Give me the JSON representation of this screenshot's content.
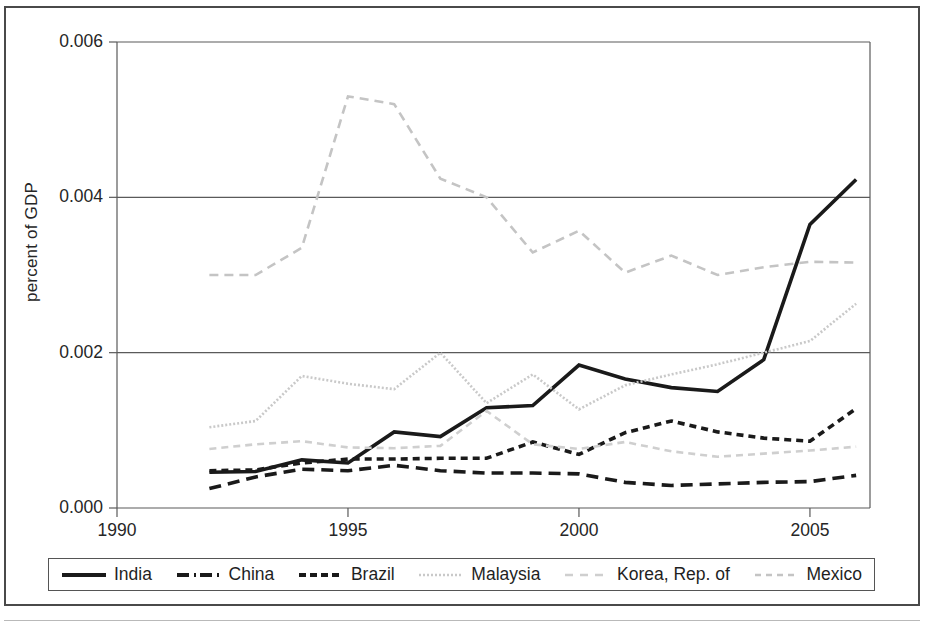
{
  "figure": {
    "yaxis_title": "percent of GDP",
    "ytick_labels": [
      "0.006",
      "0.004",
      "0.002",
      "0.000"
    ],
    "xtick_labels": [
      "1990",
      "1995",
      "2000",
      "2005"
    ]
  },
  "legend": {
    "items": [
      {
        "label": "India",
        "style": "solid-thick-black",
        "color": "#1a1a1a"
      },
      {
        "label": "China",
        "style": "dashdot-thick-black",
        "color": "#1a1a1a"
      },
      {
        "label": "Brazil",
        "style": "dashed-thick-black",
        "color": "#1a1a1a"
      },
      {
        "label": "Malaysia",
        "style": "solid-thin-gray",
        "color": "#c9c9c9"
      },
      {
        "label": "Korea, Rep. of",
        "style": "dashed-thin-gray",
        "color": "#cfcfcf"
      },
      {
        "label": "Mexico",
        "style": "dashed-gray",
        "color": "#c4c4c4"
      }
    ]
  },
  "chart_data": {
    "type": "line",
    "title": "",
    "xlabel": "",
    "ylabel": "percent of GDP",
    "xlim": [
      1990,
      2006.3
    ],
    "ylim": [
      0.0,
      0.006
    ],
    "yticks": [
      0.0,
      0.002,
      0.004,
      0.006
    ],
    "xticks": [
      1990,
      1995,
      2000,
      2005
    ],
    "grid": "horizontal",
    "legend_position": "below-axes",
    "x": [
      1992,
      1993,
      1994,
      1995,
      1996,
      1997,
      1998,
      1999,
      2000,
      2001,
      2002,
      2003,
      2004,
      2005,
      2006
    ],
    "series": [
      {
        "name": "India",
        "color": "#1a1a1a",
        "dash": "none",
        "width": 3.6,
        "values": [
          0.00046,
          0.00047,
          0.00062,
          0.00058,
          0.00098,
          0.00092,
          0.00129,
          0.00132,
          0.00184,
          0.00166,
          0.00155,
          0.0015,
          0.00191,
          0.00365,
          0.00423
        ]
      },
      {
        "name": "China",
        "color": "#1a1a1a",
        "dash": "12,7",
        "width": 3.6,
        "values": [
          0.00025,
          0.0004,
          0.0005,
          0.00048,
          0.00055,
          0.00048,
          0.00045,
          0.00045,
          0.00044,
          0.00033,
          0.00029,
          0.00031,
          0.00033,
          0.00034,
          0.00042
        ]
      },
      {
        "name": "Brazil",
        "color": "#1a1a1a",
        "dash": "7,5",
        "width": 3.6,
        "values": [
          0.00048,
          0.00049,
          0.00058,
          0.00063,
          0.00063,
          0.00064,
          0.00064,
          0.00085,
          0.00069,
          0.00097,
          0.00112,
          0.00098,
          0.0009,
          0.00086,
          0.00128
        ]
      },
      {
        "name": "Malaysia",
        "color": "#c9c9c9",
        "dash": "2,2",
        "width": 2.6,
        "values": [
          0.00104,
          0.00112,
          0.0017,
          0.0016,
          0.00153,
          0.002,
          0.00135,
          0.00172,
          0.00127,
          0.00158,
          0.00172,
          0.00185,
          0.002,
          0.00215,
          0.00263
        ]
      },
      {
        "name": "Korea, Rep. of",
        "color": "#cfcfcf",
        "dash": "7,5",
        "width": 2.6,
        "values": [
          0.00076,
          0.00082,
          0.00086,
          0.00078,
          0.00077,
          0.0008,
          0.00125,
          0.00082,
          0.00076,
          0.00085,
          0.00073,
          0.00066,
          0.0007,
          0.00074,
          0.00079
        ]
      },
      {
        "name": "Mexico",
        "color": "#c4c4c4",
        "dash": "9,6",
        "width": 2.6,
        "values": [
          0.003,
          0.003,
          0.00335,
          0.0053,
          0.0052,
          0.00424,
          0.004,
          0.00329,
          0.00357,
          0.00303,
          0.00325,
          0.003,
          0.0031,
          0.00317,
          0.00316
        ]
      }
    ]
  }
}
